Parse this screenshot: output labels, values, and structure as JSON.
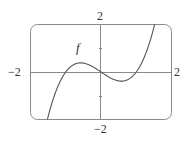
{
  "chart_data": {
    "type": "line",
    "title": "",
    "xlabel": "",
    "ylabel": "",
    "xlim": [
      -2,
      2
    ],
    "ylim": [
      -2,
      2
    ],
    "grid": false,
    "x_tick_labels": [
      "-2",
      "2"
    ],
    "y_tick_labels": [
      "2",
      "-2"
    ],
    "y_minor_ticks": [
      1,
      -1
    ],
    "series": [
      {
        "name": "f",
        "expression": "f(x) = x^3 - x",
        "x": [
          -1.52,
          -1.25,
          -1.0,
          -0.75,
          -0.577,
          -0.25,
          0.0,
          0.25,
          0.577,
          0.75,
          1.0,
          1.25,
          1.52
        ],
        "values": [
          -2.0,
          -0.7,
          0.0,
          0.33,
          0.385,
          0.23,
          0.0,
          -0.23,
          -0.385,
          -0.33,
          0.0,
          0.7,
          2.0
        ]
      }
    ],
    "annotations": [
      {
        "text": "f",
        "x": -0.6,
        "y": 0.9
      }
    ],
    "colors": {
      "curve": "#555555",
      "frame": "#8a8a8a",
      "axes": "#8a8a8a",
      "labels": "#333333"
    }
  },
  "labels": {
    "x_min": "−2",
    "x_max": "2",
    "y_max": "2",
    "y_min": "−2",
    "function_name": "f"
  }
}
